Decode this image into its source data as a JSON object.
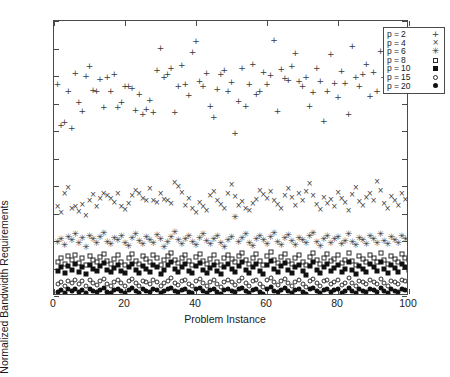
{
  "chart_data": {
    "type": "scatter",
    "title": "",
    "xlabel": "Problem Instance",
    "ylabel": "Normalized Bandwidth Requirements",
    "xlim": [
      0,
      100
    ],
    "ylim": [
      1,
      1.5
    ],
    "grid": false,
    "legend_position": "top-right",
    "xticks": [
      "0",
      "20",
      "40",
      "60",
      "80",
      "100"
    ],
    "xtick_values": [
      0,
      20,
      40,
      60,
      80,
      100
    ],
    "yticks": [
      "1",
      "1.05",
      "1.1",
      "1.15",
      "1.2",
      "1.25",
      "1.3",
      "1.35",
      "1.4",
      "1.45",
      "1.5"
    ],
    "ytick_values": [
      1,
      1.05,
      1.1,
      1.15,
      1.2,
      1.25,
      1.3,
      1.35,
      1.4,
      1.45,
      1.5
    ],
    "x": [
      1,
      2,
      3,
      4,
      5,
      6,
      7,
      8,
      9,
      10,
      11,
      12,
      13,
      14,
      15,
      16,
      17,
      18,
      19,
      20,
      21,
      22,
      23,
      24,
      25,
      26,
      27,
      28,
      29,
      30,
      31,
      32,
      33,
      34,
      35,
      36,
      37,
      38,
      39,
      40,
      41,
      42,
      43,
      44,
      45,
      46,
      47,
      48,
      49,
      50,
      51,
      52,
      53,
      54,
      55,
      56,
      57,
      58,
      59,
      60,
      61,
      62,
      63,
      64,
      65,
      66,
      67,
      68,
      69,
      70,
      71,
      72,
      73,
      74,
      75,
      76,
      77,
      78,
      79,
      80,
      81,
      82,
      83,
      84,
      85,
      86,
      87,
      88,
      89,
      90,
      91,
      92,
      93,
      94,
      95,
      96,
      97,
      98,
      99,
      100
    ],
    "series": [
      {
        "name": "p = 2",
        "marker": "plus",
        "glyph": "+",
        "color": "#3a3a3a",
        "values": [
          1.385,
          1.311,
          1.317,
          1.373,
          1.305,
          1.405,
          1.352,
          1.337,
          1.4,
          1.418,
          1.374,
          1.372,
          1.394,
          1.344,
          1.398,
          1.372,
          1.404,
          1.344,
          1.352,
          1.382,
          1.381,
          1.379,
          1.339,
          1.368,
          1.331,
          1.34,
          1.357,
          1.334,
          1.411,
          1.451,
          1.398,
          1.403,
          1.415,
          1.334,
          1.381,
          1.42,
          1.386,
          1.366,
          1.443,
          1.463,
          1.391,
          1.382,
          1.405,
          1.345,
          1.326,
          1.377,
          1.404,
          1.411,
          1.373,
          1.389,
          1.296,
          1.354,
          1.414,
          1.345,
          1.385,
          1.421,
          1.367,
          1.372,
          1.407,
          1.386,
          1.402,
          1.465,
          1.337,
          1.413,
          1.396,
          1.392,
          1.419,
          1.442,
          1.391,
          1.381,
          1.399,
          1.345,
          1.371,
          1.414,
          1.391,
          1.318,
          1.372,
          1.44,
          1.387,
          1.362,
          1.409,
          1.388,
          1.331,
          1.455,
          1.398,
          1.381,
          1.404,
          1.422,
          1.364,
          1.407,
          1.372,
          1.445,
          1.399,
          1.416,
          1.39,
          1.374,
          1.405,
          1.428,
          1.393,
          1.411
        ]
      },
      {
        "name": "p = 4",
        "marker": "cross",
        "glyph": "×",
        "color": "#3a3a3a",
        "values": [
          1.161,
          1.151,
          1.185,
          1.196,
          1.158,
          1.161,
          1.153,
          1.166,
          1.146,
          1.172,
          1.183,
          1.161,
          1.176,
          1.185,
          1.181,
          1.177,
          1.169,
          1.186,
          1.162,
          1.157,
          1.168,
          1.181,
          1.191,
          1.185,
          1.177,
          1.172,
          1.195,
          1.173,
          1.169,
          1.186,
          1.175,
          1.172,
          1.167,
          1.205,
          1.199,
          1.188,
          1.163,
          1.176,
          1.159,
          1.151,
          1.169,
          1.162,
          1.155,
          1.181,
          1.19,
          1.172,
          1.165,
          1.158,
          1.186,
          1.201,
          1.18,
          1.163,
          1.171,
          1.158,
          1.155,
          1.168,
          1.174,
          1.191,
          1.183,
          1.176,
          1.189,
          1.172,
          1.166,
          1.158,
          1.181,
          1.195,
          1.178,
          1.163,
          1.186,
          1.172,
          1.19,
          1.203,
          1.182,
          1.165,
          1.157,
          1.179,
          1.168,
          1.174,
          1.161,
          1.188,
          1.176,
          1.169,
          1.155,
          1.183,
          1.197,
          1.171,
          1.164,
          1.179,
          1.186,
          1.173,
          1.208,
          1.191,
          1.167,
          1.158,
          1.18,
          1.172,
          1.163,
          1.186,
          1.175,
          1.169
        ]
      },
      {
        "name": "p = 6",
        "marker": "star",
        "glyph": "✳",
        "color": "#3a3a3a",
        "values": [
          1.098,
          1.104,
          1.092,
          1.108,
          1.101,
          1.113,
          1.096,
          1.105,
          1.089,
          1.11,
          1.103,
          1.097,
          1.107,
          1.115,
          1.099,
          1.094,
          1.106,
          1.102,
          1.11,
          1.096,
          1.091,
          1.105,
          1.113,
          1.1,
          1.095,
          1.108,
          1.102,
          1.097,
          1.111,
          1.104,
          1.09,
          1.099,
          1.107,
          1.116,
          1.101,
          1.094,
          1.103,
          1.109,
          1.098,
          1.092,
          1.106,
          1.113,
          1.1,
          1.095,
          1.104,
          1.11,
          1.097,
          1.089,
          1.102,
          1.108,
          1.143,
          1.099,
          1.105,
          1.112,
          1.096,
          1.091,
          1.103,
          1.109,
          1.101,
          1.094,
          1.107,
          1.114,
          1.098,
          1.092,
          1.105,
          1.111,
          1.1,
          1.093,
          1.106,
          1.102,
          1.096,
          1.109,
          1.115,
          1.099,
          1.091,
          1.104,
          1.11,
          1.097,
          1.103,
          1.108,
          1.094,
          1.1,
          1.112,
          1.098,
          1.092,
          1.106,
          1.101,
          1.095,
          1.109,
          1.103,
          1.097,
          1.113,
          1.1,
          1.094,
          1.107,
          1.102,
          1.096,
          1.11,
          1.104,
          1.099
        ]
      },
      {
        "name": "p = 8",
        "marker": "open-square",
        "glyph": "□",
        "color": "#2b2b2b",
        "values": [
          1.062,
          1.069,
          1.058,
          1.072,
          1.065,
          1.075,
          1.06,
          1.07,
          1.056,
          1.073,
          1.066,
          1.061,
          1.071,
          1.077,
          1.064,
          1.059,
          1.068,
          1.074,
          1.062,
          1.057,
          1.07,
          1.076,
          1.063,
          1.058,
          1.072,
          1.067,
          1.061,
          1.074,
          1.069,
          1.056,
          1.065,
          1.073,
          1.079,
          1.066,
          1.06,
          1.07,
          1.075,
          1.063,
          1.057,
          1.071,
          1.077,
          1.064,
          1.059,
          1.068,
          1.074,
          1.062,
          1.056,
          1.069,
          1.075,
          1.067,
          1.061,
          1.072,
          1.078,
          1.065,
          1.058,
          1.07,
          1.076,
          1.063,
          1.057,
          1.073,
          1.08,
          1.066,
          1.06,
          1.071,
          1.077,
          1.064,
          1.058,
          1.069,
          1.074,
          1.062,
          1.056,
          1.071,
          1.078,
          1.065,
          1.059,
          1.07,
          1.076,
          1.063,
          1.068,
          1.074,
          1.06,
          1.066,
          1.079,
          1.064,
          1.057,
          1.072,
          1.067,
          1.061,
          1.075,
          1.069,
          1.062,
          1.078,
          1.066,
          1.059,
          1.073,
          1.068,
          1.061,
          1.076,
          1.07,
          1.065
        ]
      },
      {
        "name": "p = 10",
        "marker": "filled-square",
        "glyph": "■",
        "color": "#111111",
        "values": [
          1.046,
          1.052,
          1.042,
          1.055,
          1.048,
          1.058,
          1.044,
          1.053,
          1.04,
          1.056,
          1.05,
          1.045,
          1.054,
          1.06,
          1.047,
          1.043,
          1.051,
          1.057,
          1.046,
          1.041,
          1.053,
          1.059,
          1.047,
          1.042,
          1.055,
          1.05,
          1.044,
          1.057,
          1.052,
          1.04,
          1.048,
          1.056,
          1.062,
          1.049,
          1.043,
          1.053,
          1.058,
          1.046,
          1.041,
          1.054,
          1.06,
          1.047,
          1.042,
          1.051,
          1.057,
          1.045,
          1.04,
          1.052,
          1.058,
          1.05,
          1.044,
          1.055,
          1.061,
          1.048,
          1.041,
          1.053,
          1.059,
          1.046,
          1.04,
          1.056,
          1.063,
          1.049,
          1.043,
          1.054,
          1.06,
          1.047,
          1.041,
          1.052,
          1.057,
          1.045,
          1.039,
          1.054,
          1.061,
          1.048,
          1.042,
          1.053,
          1.059,
          1.046,
          1.051,
          1.057,
          1.043,
          1.049,
          1.062,
          1.047,
          1.04,
          1.055,
          1.05,
          1.044,
          1.058,
          1.052,
          1.045,
          1.061,
          1.049,
          1.042,
          1.056,
          1.051,
          1.044,
          1.059,
          1.053,
          1.048
        ]
      },
      {
        "name": "p = 15",
        "marker": "open-circle",
        "glyph": "○",
        "color": "#2b2b2b",
        "values": [
          1.022,
          1.026,
          1.019,
          1.028,
          1.023,
          1.03,
          1.021,
          1.027,
          1.018,
          1.029,
          1.024,
          1.02,
          1.027,
          1.031,
          1.022,
          1.019,
          1.026,
          1.029,
          1.023,
          1.018,
          1.027,
          1.031,
          1.024,
          1.019,
          1.028,
          1.025,
          1.021,
          1.029,
          1.026,
          1.018,
          1.023,
          1.028,
          1.032,
          1.024,
          1.02,
          1.027,
          1.03,
          1.022,
          1.018,
          1.028,
          1.031,
          1.024,
          1.019,
          1.026,
          1.029,
          1.022,
          1.017,
          1.026,
          1.03,
          1.025,
          1.02,
          1.028,
          1.032,
          1.023,
          1.018,
          1.027,
          1.03,
          1.022,
          1.017,
          1.029,
          1.033,
          1.025,
          1.02,
          1.027,
          1.031,
          1.023,
          1.018,
          1.026,
          1.029,
          1.022,
          1.017,
          1.027,
          1.031,
          1.024,
          1.019,
          1.027,
          1.03,
          1.022,
          1.026,
          1.029,
          1.02,
          1.024,
          1.032,
          1.023,
          1.018,
          1.028,
          1.025,
          1.021,
          1.029,
          1.026,
          1.022,
          1.031,
          1.024,
          1.019,
          1.028,
          1.025,
          1.021,
          1.03,
          1.027,
          1.024
        ]
      },
      {
        "name": "p = 20",
        "marker": "filled-circle",
        "glyph": "●",
        "color": "#111111",
        "values": [
          1.008,
          1.011,
          1.006,
          1.012,
          1.009,
          1.013,
          1.007,
          1.011,
          1.005,
          1.012,
          1.01,
          1.007,
          1.011,
          1.014,
          1.008,
          1.006,
          1.011,
          1.013,
          1.009,
          1.005,
          1.011,
          1.014,
          1.01,
          1.006,
          1.012,
          1.01,
          1.007,
          1.013,
          1.011,
          1.005,
          1.009,
          1.012,
          1.015,
          1.01,
          1.007,
          1.011,
          1.013,
          1.008,
          1.005,
          1.012,
          1.014,
          1.01,
          1.006,
          1.011,
          1.013,
          1.008,
          1.004,
          1.011,
          1.013,
          1.01,
          1.007,
          1.012,
          1.015,
          1.009,
          1.005,
          1.011,
          1.013,
          1.008,
          1.004,
          1.012,
          1.016,
          1.01,
          1.007,
          1.011,
          1.014,
          1.009,
          1.005,
          1.011,
          1.013,
          1.008,
          1.004,
          1.012,
          1.014,
          1.01,
          1.006,
          1.011,
          1.013,
          1.008,
          1.011,
          1.013,
          1.006,
          1.01,
          1.015,
          1.009,
          1.005,
          1.012,
          1.01,
          1.007,
          1.013,
          1.011,
          1.008,
          1.014,
          1.01,
          1.006,
          1.012,
          1.01,
          1.007,
          1.013,
          1.011,
          1.009
        ]
      }
    ]
  }
}
